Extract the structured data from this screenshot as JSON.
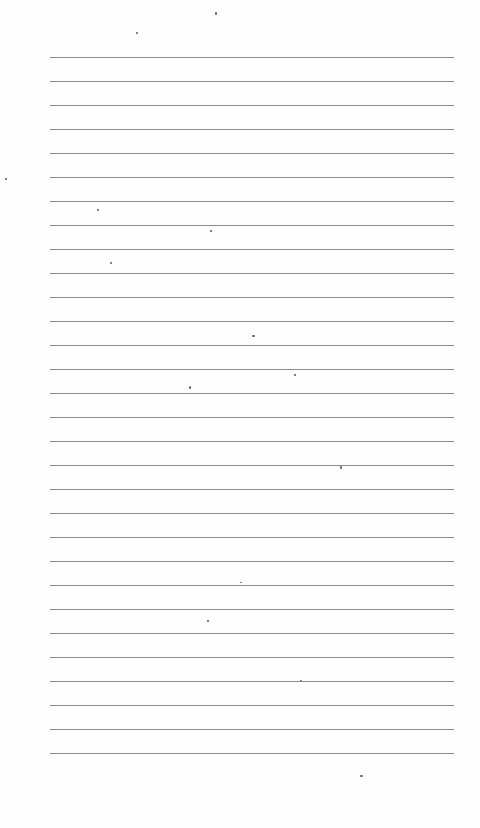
{
  "document": {
    "type": "lined-paper",
    "text": "",
    "rules": {
      "count": 30,
      "first_y": 57,
      "spacing": 24,
      "left": 50,
      "right": 454,
      "color": "#8a8a8a"
    },
    "background_color": "#fefefe"
  }
}
